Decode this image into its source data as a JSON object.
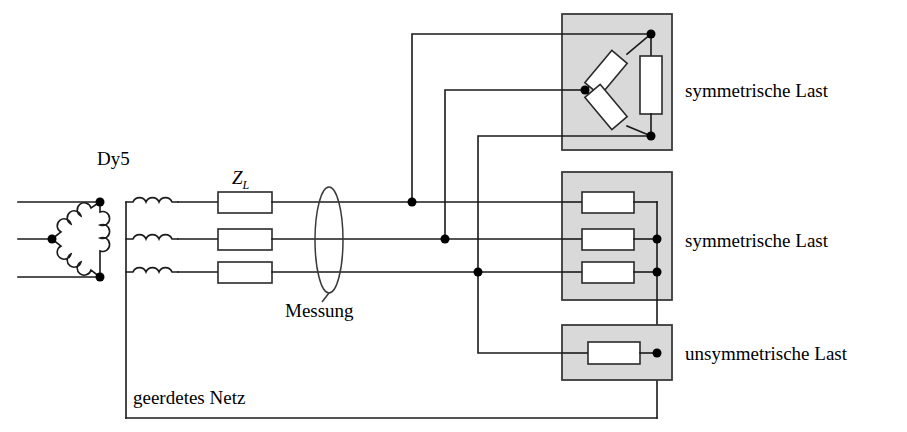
{
  "diagram": {
    "background_color": "#ffffff",
    "wire_color": "#1a1a1a",
    "box_fill_color": "#d9d9d9",
    "box_stroke_color": "#3a3a3a",
    "resistor_fill_color": "#ffffff"
  },
  "labels": {
    "transformer": "Dy5",
    "line_impedance": "Z",
    "line_impedance_subscript": "L",
    "measurement": "Messung",
    "grounded_network": "geerdetes Netz",
    "load_top": "symmetrische Last",
    "load_middle": "symmetrische Last",
    "load_bottom": "unsymmetrische Last"
  },
  "components": {
    "transformer": {
      "name": "Dy5",
      "primary_connection": "delta",
      "secondary_connection": "star",
      "vector_group": "Dy5",
      "primary_terminals": 3,
      "secondary_windings": 3
    },
    "line_impedances": {
      "label": "Z_L",
      "count": 3,
      "phases": [
        "L1",
        "L2",
        "L3"
      ]
    },
    "measurement": {
      "label": "Messung",
      "shape": "ellipse",
      "encircles_phases": 3
    },
    "loads": [
      {
        "id": "load-top",
        "label": "symmetrische Last",
        "connection": "delta",
        "resistor_count": 3,
        "balanced": true
      },
      {
        "id": "load-middle",
        "label": "symmetrische Last",
        "connection": "star",
        "resistor_count": 3,
        "balanced": true
      },
      {
        "id": "load-bottom",
        "label": "unsymmetrische Last",
        "connection": "single-phase",
        "resistor_count": 1,
        "balanced": false
      }
    ],
    "neutral": {
      "label": "geerdetes Netz",
      "grounded": true
    }
  }
}
